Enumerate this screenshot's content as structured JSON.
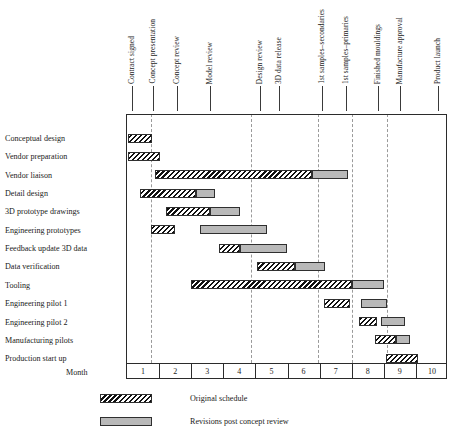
{
  "chart_data": {
    "type": "bar",
    "subtype": "gantt",
    "title": "",
    "xlabel": "Month",
    "ylabel": "",
    "xlim": [
      1,
      11
    ],
    "grid": true,
    "legend_position": "bottom-left",
    "month_axis": {
      "label": "Month",
      "ticks": [
        "1",
        "2",
        "3",
        "4",
        "5",
        "6",
        "7",
        "8",
        "9",
        "10"
      ]
    },
    "milestones": [
      {
        "label": "Contract signed",
        "month": 1.18
      },
      {
        "label": "Concept presentation",
        "month": 1.84
      },
      {
        "label": "Concept review",
        "month": 2.58
      },
      {
        "label": "Model review",
        "month": 3.62
      },
      {
        "label": "Design review",
        "month": 5.17
      },
      {
        "label": "3D data release",
        "month": 5.77
      },
      {
        "label": "1st samples–secondaries",
        "month": 7.11
      },
      {
        "label": "1st samples–primaries",
        "month": 7.85
      },
      {
        "label": "Finished mouldings",
        "month": 8.85
      },
      {
        "label": "Manufacture approval",
        "month": 9.53
      },
      {
        "label": "Product launch",
        "month": 10.71
      }
    ],
    "guides": [
      1.78,
      4.88,
      6.99,
      8.05,
      9.14
    ],
    "series": [
      {
        "name": "Original schedule",
        "key": "original",
        "pattern": "diagonal-hatch"
      },
      {
        "name": "Revisions post concept review",
        "key": "revision",
        "pattern": "solid-grey"
      }
    ],
    "tasks": [
      {
        "label": "Conceptual design",
        "original": [
          1.06,
          1.81
        ],
        "revision": null
      },
      {
        "label": "Vendor preparation",
        "original": [
          1.06,
          2.06
        ],
        "revision": null
      },
      {
        "label": "Vendor liaison",
        "original": [
          1.9,
          6.8
        ],
        "revision": [
          6.8,
          7.91
        ]
      },
      {
        "label": "Detail design",
        "original": [
          1.44,
          3.18
        ],
        "revision": [
          3.18,
          3.78
        ]
      },
      {
        "label": "3D prototype drawings",
        "original": [
          2.25,
          3.62
        ],
        "revision": [
          3.62,
          4.55
        ]
      },
      {
        "label": "Engineering prototypes",
        "original": [
          1.78,
          2.53
        ],
        "revision": [
          3.31,
          5.4
        ]
      },
      {
        "label": "Feedback update 3D data",
        "original": [
          3.9,
          4.56
        ],
        "revision": [
          4.56,
          6.03
        ]
      },
      {
        "label": "Data verification",
        "original": [
          5.09,
          6.27
        ],
        "revision": [
          6.27,
          7.2
        ]
      },
      {
        "label": "Tooling",
        "original": [
          3.03,
          8.05
        ],
        "revision": [
          8.05,
          9.04
        ]
      },
      {
        "label": "Engineering pilot 1",
        "original": [
          7.17,
          7.98
        ],
        "revision": [
          8.32,
          9.13
        ]
      },
      {
        "label": "Engineering pilot 2",
        "original": [
          8.26,
          8.83
        ],
        "revision": [
          8.95,
          9.7
        ]
      },
      {
        "label": "Manufacturing pilots",
        "original": [
          8.76,
          9.42
        ],
        "revision": [
          9.42,
          9.86
        ]
      },
      {
        "label": "Production start up",
        "original": [
          9.11,
          10.1
        ],
        "revision": null
      }
    ],
    "legend": [
      {
        "label": "Original schedule",
        "swatch": "diagonal-hatch"
      },
      {
        "label": "Revisions post concept review",
        "swatch": "solid-grey"
      }
    ],
    "colors": {
      "hatch": "#111111",
      "revision_fill": "#b9b9b9",
      "border": "#2f2f2f",
      "guide": "#9a9a9a",
      "text": "#1a1a1a"
    }
  }
}
